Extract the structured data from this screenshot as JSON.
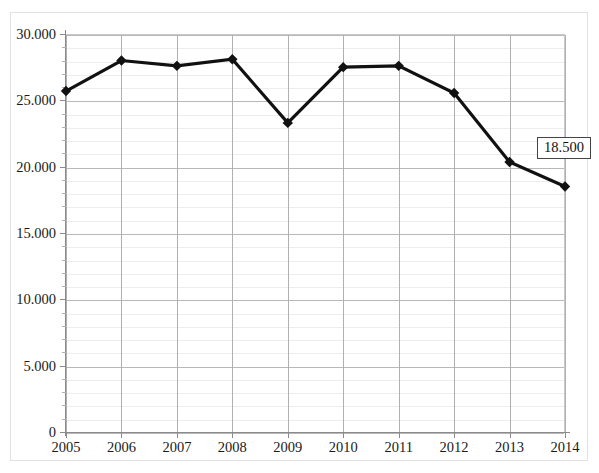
{
  "chart_data": {
    "type": "line",
    "title": "",
    "subtitle": "",
    "xlabel": "",
    "ylabel": "",
    "categories": [
      "2005",
      "2006",
      "2007",
      "2008",
      "2009",
      "2010",
      "2011",
      "2012",
      "2013",
      "2014"
    ],
    "values": [
      25700,
      28000,
      27600,
      28100,
      23300,
      27500,
      27600,
      25550,
      20350,
      18500
    ],
    "series": [
      {
        "name": "",
        "values": [
          25700,
          28000,
          27600,
          28100,
          23300,
          27500,
          27600,
          25550,
          20350,
          18500
        ]
      }
    ],
    "ylim": [
      0,
      30000
    ],
    "y_major_step": 5000,
    "y_minor_step": 1000,
    "y_tick_labels": [
      "30.000",
      "25.000",
      "20.000",
      "15.000",
      "10.000",
      "5.000",
      "0"
    ],
    "y_tick_values": [
      30000,
      25000,
      20000,
      15000,
      10000,
      5000,
      0
    ],
    "x_tick_labels": [
      "2005",
      "2006",
      "2007",
      "2008",
      "2009",
      "2010",
      "2011",
      "2012",
      "2013",
      "2014"
    ],
    "grid": "major-and-minor-horizontal-plus-vertical-major",
    "legend": "none",
    "marker": "diamond",
    "line_color": "#111111",
    "marker_color": "#111111",
    "grid_major_color": "#b8b8b8",
    "grid_minor_color": "#ededed",
    "axis_color": "#8a8a8a",
    "background_color": "#ffffff",
    "annotations": [
      {
        "name": "last-point-value-label",
        "text": "18.500",
        "attached_to_category": "2014",
        "attached_to_value": 18500
      }
    ]
  },
  "annotation_label": {
    "text": "18.500"
  }
}
